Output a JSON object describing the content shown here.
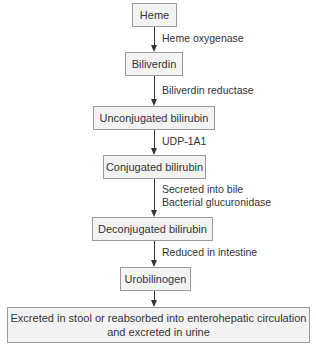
{
  "diagram": {
    "nodes": [
      {
        "id": "heme",
        "label": "Heme"
      },
      {
        "id": "biliverdin",
        "label": "Biliverdin"
      },
      {
        "id": "unconjugated",
        "label": "Unconjugated bilirubin"
      },
      {
        "id": "conjugated",
        "label": "Conjugated bilirubin"
      },
      {
        "id": "deconjugated",
        "label": "Deconjugated bilirubin"
      },
      {
        "id": "urobilinogen",
        "label": "Urobilinogen"
      },
      {
        "id": "excreted",
        "label_line1": "Excreted in stool or reabsorbed into enterohepatic circulation",
        "label_line2": "and excreted in urine"
      }
    ],
    "edges": [
      {
        "from": "heme",
        "to": "biliverdin",
        "label": "Heme oxygenase"
      },
      {
        "from": "biliverdin",
        "to": "unconjugated",
        "label": "Biliverdin reductase"
      },
      {
        "from": "unconjugated",
        "to": "conjugated",
        "label": "UDP-1A1"
      },
      {
        "from": "conjugated",
        "to": "deconjugated",
        "label_line1": "Secreted into bile",
        "label_line2": "Bacterial glucuronidase"
      },
      {
        "from": "deconjugated",
        "to": "urobilinogen",
        "label": "Reduced in intestine"
      },
      {
        "from": "urobilinogen",
        "to": "excreted",
        "label": ""
      }
    ]
  }
}
